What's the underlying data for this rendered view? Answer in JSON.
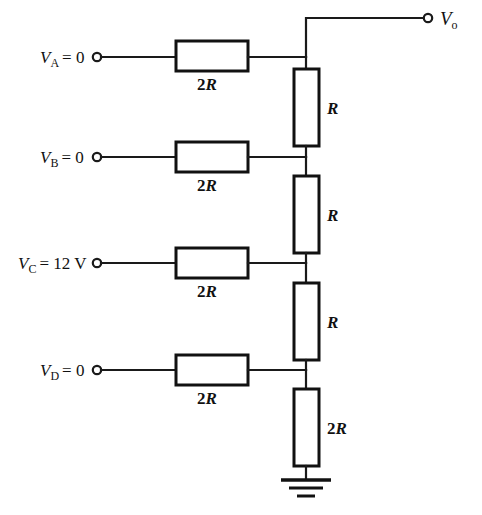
{
  "diagram": {
    "background_color": "#ffffff",
    "line_color": "#1a1a1a"
  },
  "output": {
    "label_main": "V",
    "label_sub": "o",
    "terminal": "open-circle"
  },
  "inputs": [
    {
      "id": "A",
      "label_main": "V",
      "label_sub": "A",
      "equals": "= 0",
      "value": "0",
      "series_resistor": "2R",
      "rung_y": 57
    },
    {
      "id": "B",
      "label_main": "V",
      "label_sub": "B",
      "equals": "= 0",
      "value": "0",
      "series_resistor": "2R",
      "rung_y": 157
    },
    {
      "id": "C",
      "label_main": "V",
      "label_sub": "C",
      "equals": "= 12 V",
      "value": "12 V",
      "series_resistor": "2R",
      "rung_y": 263
    },
    {
      "id": "D",
      "label_main": "V",
      "label_sub": "D",
      "equals": "= 0",
      "value": "0",
      "series_resistor": "2R",
      "rung_y": 370
    }
  ],
  "series_resistors": [
    {
      "label": "2R",
      "num": "2",
      "letter": "R",
      "rung_y": 57
    },
    {
      "label": "2R",
      "num": "2",
      "letter": "R",
      "rung_y": 157
    },
    {
      "label": "2R",
      "num": "2",
      "letter": "R",
      "rung_y": 263
    },
    {
      "label": "2R",
      "num": "2",
      "letter": "R",
      "rung_y": 370
    }
  ],
  "ladder_resistors": [
    {
      "label": "R",
      "num": "",
      "letter": "R",
      "from_y": 57,
      "to_y": 157
    },
    {
      "label": "R",
      "num": "",
      "letter": "R",
      "from_y": 157,
      "to_y": 263
    },
    {
      "label": "R",
      "num": "",
      "letter": "R",
      "from_y": 263,
      "to_y": 370
    },
    {
      "label": "2R",
      "num": "2",
      "letter": "R",
      "from_y": 370,
      "to_y": 466
    }
  ],
  "ground": {
    "symbol": "earth-ground",
    "bars": 3
  }
}
